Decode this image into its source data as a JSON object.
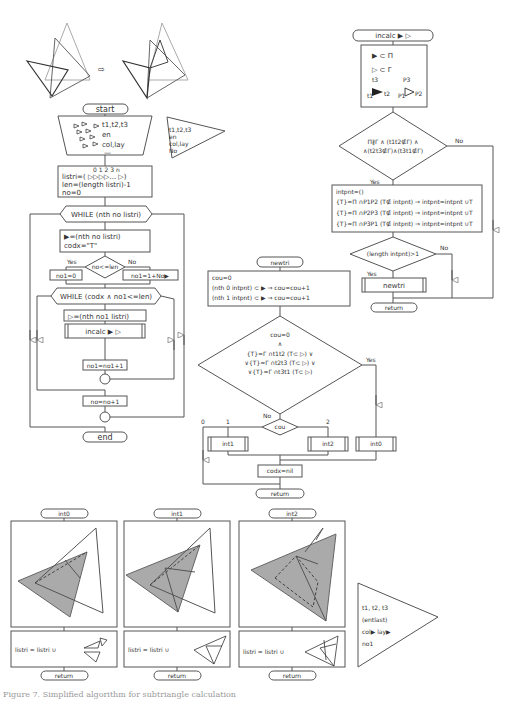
{
  "top_illustration": {
    "arrow": "⇨"
  },
  "main_flow": {
    "start": "start",
    "input_block": {
      "lines": [
        "t1,t2,t3",
        "en",
        "col,lay",
        "—"
      ]
    },
    "input_triangle": {
      "lines": [
        "t1,t2,t3",
        "en",
        "col,lay",
        "No"
      ]
    },
    "init": {
      "indices": "0 1 2 3      n",
      "lines": [
        "listri=( ▷▷▷▷... ▷)",
        "len=(length listri)-1",
        "no=0"
      ]
    },
    "while1": "WHILE (nth no listri)",
    "assign1": [
      "▶=(nth no listri)",
      "codx=\"T\""
    ],
    "decision": "no<=len",
    "yes": "Yes",
    "no": "No",
    "no1_zero": "no1=0",
    "no1_inc": "no1=1+No▶",
    "while2": "WHILE (codx ∧ no1<=len)",
    "assign2": "▷=(nth no1 listri)",
    "incalc_call": "incalc ▶ ▷",
    "no1_step": "no1=no1+1",
    "no_step": "no=no+1",
    "end": "end"
  },
  "incalc": {
    "header": "incalc ▶ ▷",
    "defs": [
      "▶ ⊂ Π",
      "▷ ⊂ Γ"
    ],
    "labels": {
      "t1": "t1",
      "t2": "t2",
      "t3": "t3",
      "p1": "P1",
      "p2": "P2",
      "p3": "P3"
    },
    "condition": [
      "Π∦Γ ∧ (t1t2∉Γ) ∧",
      "∧(t2t3∉Γ)∧(t3t1∉Γ)"
    ],
    "yes": "Yes",
    "no": "No",
    "intpnt": [
      "intpnt=()",
      "{T}=Π ∩P1P2  (T∉ intpnt) ⇒ intpnt=intpnt ∪T",
      "{T}=Π ∩P2P3  (T∉ intpnt) ⇒ intpnt=intpnt ∪T",
      "{T}=Π ∩P3P1  (T∉ intpnt) ⇒ intpnt=intpnt ∪T"
    ],
    "length_cond": "(length intpnt)>1",
    "newtri_call": "newtri",
    "return": "return"
  },
  "newtri": {
    "header": "newtri",
    "init": [
      "cou=0",
      "(nth 0 intpnt) ⊂ ▶  ⇒  cou=cou+1",
      "(nth 1 intpnt) ⊂ ▶  ⇒  cou=cou+1"
    ],
    "condition": [
      "cou=0",
      "∧",
      "{T}=Γ ∩t1t2  (T⊂ ▷) ∨",
      "∨{T}=Γ ∩t2t3  (T⊂ ▷) ∨",
      "∨{T}=Γ ∩t3t1  (T⊂ ▷)"
    ],
    "yes": "Yes",
    "no": "No",
    "switch": "cou",
    "branches": [
      "0",
      "1",
      "2"
    ],
    "int1": "int1",
    "int2": "int2",
    "int0": "int0",
    "codx": "codx=nil",
    "return": "return"
  },
  "subroutines": [
    {
      "name": "int0",
      "formula": "listri = listri ∪",
      "return": "return"
    },
    {
      "name": "int1",
      "formula": "listri = listri ∪",
      "return": "return"
    },
    {
      "name": "int2",
      "formula": "listri = listri ∪",
      "return": "return"
    }
  ],
  "output_triangle": {
    "lines": [
      "t1, t2, t3",
      "(entlast)",
      "col▶  lay▶",
      "no1"
    ]
  },
  "caption": "Figure 7. Simplified algorithm for subtriangle calculation"
}
